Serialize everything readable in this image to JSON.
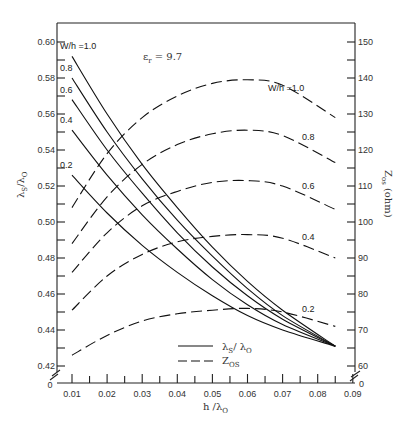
{
  "chart_data": {
    "type": "line",
    "title": "",
    "annotation": "ε_r = 9.7",
    "xlabel": "h / λ0",
    "ylabel": "λs / λ0",
    "ylabel_right": "Z0s (ohm)",
    "xlim": [
      0,
      0.09
    ],
    "ylim": [
      0.41,
      0.61
    ],
    "ylim_right": [
      57,
      155
    ],
    "x_ticks": [
      "0",
      "0.01",
      "0.02",
      "0.03",
      "0.04",
      "0.05",
      "0.06",
      "0.07",
      "0.08",
      "0.09"
    ],
    "y_ticks": [
      "0",
      "0.42",
      "0.44",
      "0.46",
      "0.48",
      "0.50",
      "0.52",
      "0.54",
      "0.56",
      "0.58",
      "0.60"
    ],
    "y_right_ticks": [
      "0",
      "60",
      "70",
      "80",
      "90",
      "100",
      "110",
      "120",
      "130",
      "140",
      "150"
    ],
    "grid": false,
    "legend": {
      "position": "lower center",
      "entries": [
        {
          "label": "λs / λ0",
          "style": "solid"
        },
        {
          "label": "Z0s",
          "style": "dashed"
        }
      ]
    },
    "x": [
      0.01,
      0.02,
      0.03,
      0.04,
      0.05,
      0.06,
      0.07,
      0.085
    ],
    "series": [
      {
        "name": "λs/λ0, W/h=1.0",
        "axis": "left",
        "style": "solid",
        "label": "W/h =1.0",
        "values": [
          0.592,
          0.56,
          0.532,
          0.508,
          0.486,
          0.467,
          0.451,
          0.431
        ]
      },
      {
        "name": "λs/λ0, W/h=0.8",
        "axis": "left",
        "style": "solid",
        "label": "0.8",
        "values": [
          0.58,
          0.55,
          0.524,
          0.501,
          0.481,
          0.463,
          0.448,
          0.431
        ]
      },
      {
        "name": "λs/λ0, W/h=0.6",
        "axis": "left",
        "style": "solid",
        "label": "0.6",
        "values": [
          0.568,
          0.54,
          0.516,
          0.494,
          0.475,
          0.459,
          0.446,
          0.431
        ]
      },
      {
        "name": "λs/λ0, W/h=0.4",
        "axis": "left",
        "style": "solid",
        "label": "0.4",
        "values": [
          0.551,
          0.526,
          0.504,
          0.485,
          0.468,
          0.454,
          0.443,
          0.431
        ]
      },
      {
        "name": "λs/λ0, W/h=0.2",
        "axis": "left",
        "style": "solid",
        "label": "0.2",
        "values": [
          0.526,
          0.505,
          0.487,
          0.472,
          0.459,
          0.448,
          0.44,
          0.431
        ]
      },
      {
        "name": "Z0s, W/h=1.0",
        "axis": "right",
        "style": "dashed",
        "label": "W/h =1.0",
        "values": [
          104,
          119,
          129,
          135,
          138.5,
          139.5,
          138,
          129
        ]
      },
      {
        "name": "Z0s, W/h=0.8",
        "axis": "right",
        "style": "dashed",
        "label": "0.8",
        "values": [
          94,
          107,
          116,
          121.5,
          124.5,
          125.5,
          124,
          116.5
        ]
      },
      {
        "name": "Z0s, W/h=0.6",
        "axis": "right",
        "style": "dashed",
        "label": "0.6",
        "values": [
          86,
          97,
          104.5,
          108.5,
          111,
          111.5,
          110,
          103.5
        ]
      },
      {
        "name": "Z0s, W/h=0.4",
        "axis": "right",
        "style": "dashed",
        "label": "0.4",
        "values": [
          75.5,
          85,
          91,
          94.5,
          96,
          96.5,
          95.5,
          90
        ]
      },
      {
        "name": "Z0s, W/h=0.2",
        "axis": "right",
        "style": "dashed",
        "label": "0.2",
        "values": [
          63,
          68.5,
          72.5,
          74.5,
          75.5,
          76,
          75,
          71
        ]
      }
    ]
  },
  "labels": {
    "epsilon": "εr = 9.7",
    "eps_symbol": "ε",
    "eps_sub": "r",
    "eps_value": " = 9.7",
    "xlabel": "h /λ",
    "xlabel_sub": "O",
    "ylabel": "λs /λ",
    "ylabel_main": "λ",
    "ylabel_s": "S",
    "ylabel_slash": "/λ",
    "ylabel_o": "O",
    "yrlabel_z": "Z",
    "yrlabel_sub": "os",
    "yrlabel_unit": " (ohm)",
    "legend_solid": "λ",
    "legend_solid_s": "S",
    "legend_solid_rest": "/ λ",
    "legend_solid_o": "O",
    "legend_dashed": "Z",
    "legend_dashed_sub": "OS"
  }
}
